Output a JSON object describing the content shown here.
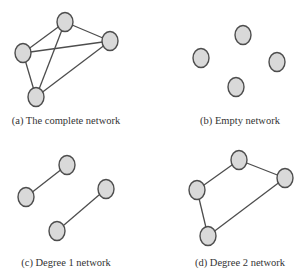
{
  "style": {
    "node_fill": "#d9d9d9",
    "node_stroke": "#4d4d4d",
    "edge_stroke": "#4d4d4d",
    "caption_color": "#333333"
  },
  "panels": [
    {
      "id": "a",
      "caption": "(a) The complete network",
      "caption_pos": [
        66,
        122
      ],
      "nodes": [
        {
          "id": "top",
          "x": 65,
          "y": 22
        },
        {
          "id": "left",
          "x": 23,
          "y": 53
        },
        {
          "id": "right",
          "x": 110,
          "y": 41
        },
        {
          "id": "bottom",
          "x": 36,
          "y": 97
        }
      ],
      "edges": [
        [
          "top",
          "left"
        ],
        [
          "top",
          "right"
        ],
        [
          "top",
          "bottom"
        ],
        [
          "left",
          "right"
        ],
        [
          "left",
          "bottom"
        ],
        [
          "right",
          "bottom"
        ]
      ]
    },
    {
      "id": "b",
      "caption": "(b) Empty network",
      "caption_pos": [
        240,
        122
      ],
      "nodes": [
        {
          "id": "top",
          "x": 243,
          "y": 35
        },
        {
          "id": "left",
          "x": 201,
          "y": 58
        },
        {
          "id": "right",
          "x": 277,
          "y": 62
        },
        {
          "id": "bottom",
          "x": 236,
          "y": 87
        }
      ],
      "edges": []
    },
    {
      "id": "c",
      "caption": "(c) Degree 1 network",
      "caption_pos": [
        66,
        264
      ],
      "nodes": [
        {
          "id": "top",
          "x": 67,
          "y": 165
        },
        {
          "id": "left",
          "x": 26,
          "y": 197
        },
        {
          "id": "right",
          "x": 106,
          "y": 189
        },
        {
          "id": "bottom",
          "x": 57,
          "y": 231
        }
      ],
      "edges": [
        [
          "top",
          "left"
        ],
        [
          "right",
          "bottom"
        ]
      ]
    },
    {
      "id": "d",
      "caption": "(d) Degree 2 network",
      "caption_pos": [
        240,
        264
      ],
      "nodes": [
        {
          "id": "top",
          "x": 239,
          "y": 160
        },
        {
          "id": "left",
          "x": 197,
          "y": 190
        },
        {
          "id": "right",
          "x": 285,
          "y": 178
        },
        {
          "id": "bottom",
          "x": 208,
          "y": 236
        }
      ],
      "edges": [
        [
          "top",
          "left"
        ],
        [
          "top",
          "right"
        ],
        [
          "left",
          "bottom"
        ],
        [
          "right",
          "bottom"
        ]
      ]
    }
  ]
}
